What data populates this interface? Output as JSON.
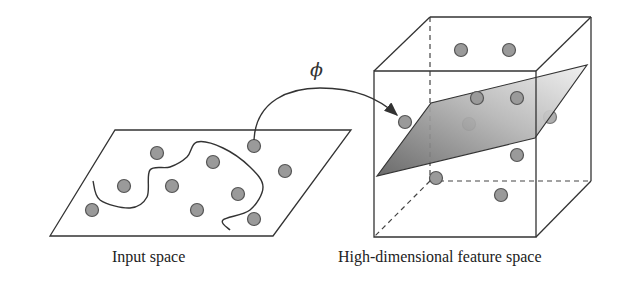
{
  "labels": {
    "input_space": "Input space",
    "feature_space": "High-dimensional feature space",
    "mapping": "ϕ"
  },
  "colors": {
    "line": "#333333",
    "dot_fill": "#9a9a9a",
    "dot_stroke": "#555555",
    "plane_dark": "#6e6e6e",
    "plane_light": "#e4e4e4"
  },
  "input_space": {
    "plane": [
      [
        115,
        130
      ],
      [
        351,
        130
      ],
      [
        273,
        236
      ],
      [
        50,
        236
      ]
    ],
    "points": [
      [
        157,
        153
      ],
      [
        213,
        162
      ],
      [
        254,
        146
      ],
      [
        285,
        171
      ],
      [
        124,
        186
      ],
      [
        172,
        186
      ],
      [
        238,
        194
      ],
      [
        92,
        210
      ],
      [
        197,
        210
      ],
      [
        254,
        219
      ]
    ],
    "boundary_curve": [
      [
        93,
        181
      ],
      [
        100,
        200
      ],
      [
        130,
        208
      ],
      [
        147,
        197
      ],
      [
        150,
        170
      ],
      [
        170,
        167
      ],
      [
        187,
        157
      ],
      [
        197,
        142
      ],
      [
        223,
        148
      ],
      [
        250,
        167
      ],
      [
        263,
        187
      ],
      [
        250,
        210
      ],
      [
        223,
        220
      ],
      [
        230,
        230
      ]
    ]
  },
  "feature_space": {
    "cube_front": [
      [
        374,
        71
      ],
      [
        536,
        71
      ],
      [
        536,
        237
      ],
      [
        374,
        237
      ]
    ],
    "cube_back": [
      [
        430,
        17
      ],
      [
        591,
        17
      ],
      [
        591,
        181
      ],
      [
        430,
        181
      ]
    ],
    "separating_plane": [
      [
        377,
        176
      ],
      [
        431,
        103
      ],
      [
        587,
        65
      ],
      [
        535,
        138
      ]
    ],
    "points_front": [
      [
        461,
        50
      ],
      [
        509,
        50
      ],
      [
        477,
        98
      ],
      [
        517,
        98
      ],
      [
        405,
        122
      ],
      [
        517,
        155
      ],
      [
        436,
        178
      ],
      [
        501,
        195
      ]
    ],
    "points_behind_plane": [
      [
        469,
        124
      ],
      [
        550,
        117
      ]
    ]
  }
}
